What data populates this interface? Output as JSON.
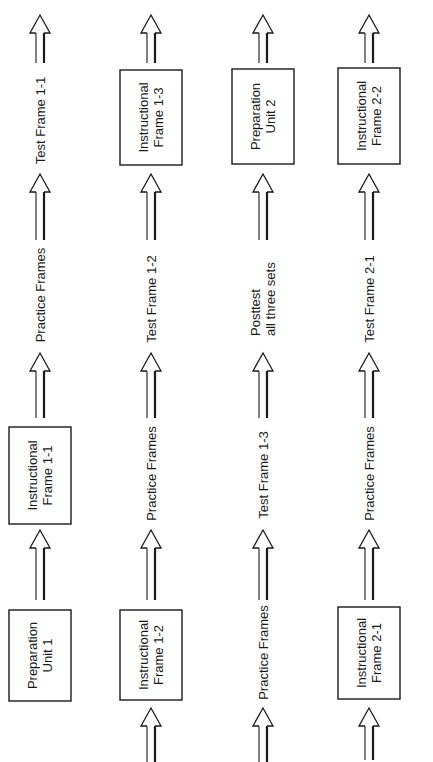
{
  "diagram": {
    "orientation": "rotated-90-ccw",
    "reading_direction": "bottom-to-top, columns left-to-right",
    "colors": {
      "ink": "#1a1a1a",
      "background": "#ffffff"
    },
    "columns": [
      {
        "id": "col1",
        "cx": 40,
        "nodes": [
          {
            "kind": "box",
            "lines": [
              "Preparation",
              "Unit 1"
            ],
            "y1": 610,
            "y2": 701
          },
          {
            "kind": "arrow",
            "tip": 530,
            "bottom": 600
          },
          {
            "kind": "box",
            "lines": [
              "Instructional",
              "Frame 1-1"
            ],
            "y1": 427,
            "y2": 524
          },
          {
            "kind": "arrow",
            "tip": 353,
            "bottom": 418
          },
          {
            "kind": "text",
            "lines": [
              "Practice Frames"
            ],
            "y1": 245,
            "y2": 345
          },
          {
            "kind": "arrow",
            "tip": 174,
            "bottom": 240
          },
          {
            "kind": "text",
            "lines": [
              "Test Frame 1-1"
            ],
            "y1": 75,
            "y2": 166
          },
          {
            "kind": "arrow",
            "tip": 15,
            "bottom": 63
          }
        ]
      },
      {
        "id": "col2",
        "cx": 151,
        "nodes": [
          {
            "kind": "arrow",
            "tip": 708,
            "bottom": 762
          },
          {
            "kind": "box",
            "lines": [
              "Instructional",
              "Frame 1-2"
            ],
            "y1": 610,
            "y2": 700
          },
          {
            "kind": "arrow",
            "tip": 530,
            "bottom": 600
          },
          {
            "kind": "text",
            "lines": [
              "Practice Frames"
            ],
            "y1": 425,
            "y2": 522
          },
          {
            "kind": "arrow",
            "tip": 353,
            "bottom": 418
          },
          {
            "kind": "text",
            "lines": [
              "Test Frame 1-2"
            ],
            "y1": 253,
            "y2": 345
          },
          {
            "kind": "arrow",
            "tip": 174,
            "bottom": 240
          },
          {
            "kind": "box",
            "lines": [
              "Instructional",
              "Frame 1-3"
            ],
            "y1": 70,
            "y2": 165
          },
          {
            "kind": "arrow",
            "tip": 15,
            "bottom": 63
          }
        ]
      },
      {
        "id": "col3",
        "cx": 263,
        "nodes": [
          {
            "kind": "arrow",
            "tip": 708,
            "bottom": 762
          },
          {
            "kind": "text",
            "lines": [
              "Practice Frames"
            ],
            "y1": 603,
            "y2": 702
          },
          {
            "kind": "arrow",
            "tip": 530,
            "bottom": 600
          },
          {
            "kind": "text",
            "lines": [
              "Test Frame 1-3"
            ],
            "y1": 430,
            "y2": 520
          },
          {
            "kind": "arrow",
            "tip": 353,
            "bottom": 418
          },
          {
            "kind": "text",
            "lines": [
              "Posttest",
              "all three sets"
            ],
            "y1": 257,
            "y2": 336,
            "align": "start"
          },
          {
            "kind": "arrow",
            "tip": 174,
            "bottom": 240
          },
          {
            "kind": "box",
            "lines": [
              "Preparation",
              "Unit 2"
            ],
            "y1": 69,
            "y2": 164
          },
          {
            "kind": "arrow",
            "tip": 15,
            "bottom": 63
          }
        ]
      },
      {
        "id": "col4",
        "cx": 369,
        "nodes": [
          {
            "kind": "arrow",
            "tip": 708,
            "bottom": 760
          },
          {
            "kind": "box",
            "lines": [
              "Instructional",
              "Frame 2-1"
            ],
            "y1": 607,
            "y2": 699
          },
          {
            "kind": "arrow",
            "tip": 530,
            "bottom": 600
          },
          {
            "kind": "text",
            "lines": [
              "Practice Frames"
            ],
            "y1": 425,
            "y2": 522
          },
          {
            "kind": "arrow",
            "tip": 353,
            "bottom": 418
          },
          {
            "kind": "text",
            "lines": [
              "Test Frame 2-1"
            ],
            "y1": 253,
            "y2": 345
          },
          {
            "kind": "arrow",
            "tip": 174,
            "bottom": 240
          },
          {
            "kind": "box",
            "lines": [
              "Instructional",
              "Frame 2-2"
            ],
            "y1": 68,
            "y2": 164
          },
          {
            "kind": "arrow",
            "tip": 15,
            "bottom": 63
          }
        ]
      }
    ],
    "box_half_width": 31
  }
}
